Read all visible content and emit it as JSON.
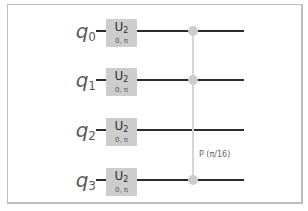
{
  "circuit": {
    "qubits": [
      {
        "label": "q",
        "index": "0",
        "gate": {
          "name": "U",
          "sub": "2",
          "params": "0, π"
        }
      },
      {
        "label": "q",
        "index": "1",
        "gate": {
          "name": "U",
          "sub": "2",
          "params": "0, π"
        }
      },
      {
        "label": "q",
        "index": "2",
        "gate": {
          "name": "U",
          "sub": "2",
          "params": "0, π"
        }
      },
      {
        "label": "q",
        "index": "3",
        "gate": {
          "name": "U",
          "sub": "2",
          "params": "0, π"
        }
      }
    ],
    "controlled_phase": {
      "label": "P (π/16)",
      "control_qubits": [
        0,
        1,
        3
      ]
    },
    "colors": {
      "wire": "#2b2b2b",
      "gate_fill": "#cdcdcd",
      "control_dot": "#cccccc",
      "connector": "#d6d6d6",
      "frame": "#bdbdbd"
    }
  }
}
